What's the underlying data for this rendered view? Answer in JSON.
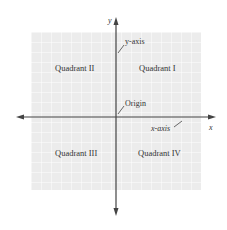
{
  "diagram": {
    "type": "cartesian-coordinate-plane",
    "colors": {
      "background": "#ffffff",
      "grid_fill": "#ececec",
      "grid_line": "#ffffff",
      "axis": "#444444",
      "text": "#333333"
    },
    "axes": {
      "x_label": "x",
      "y_label": "y",
      "x_axis_callout": "x-axis",
      "y_axis_callout": "y-axis",
      "origin_callout": "Origin"
    },
    "quadrants": [
      {
        "id": "I",
        "label": "Quadrant I"
      },
      {
        "id": "II",
        "label": "Quadrant II"
      },
      {
        "id": "III",
        "label": "Quadrant III"
      },
      {
        "id": "IV",
        "label": "Quadrant IV"
      }
    ]
  }
}
